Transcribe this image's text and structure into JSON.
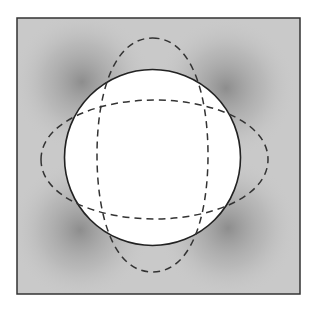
{
  "diagram": {
    "type": "deformation-illustration",
    "frame": {
      "x": 17,
      "y": 18,
      "width": 283,
      "height": 276,
      "stroke": "#333333",
      "background": "#c9c9c9"
    },
    "shading": {
      "dark_color": "#8a8a8a",
      "light_color": "#cbcbcb",
      "spots": [
        {
          "cx": 82,
          "cy": 82
        },
        {
          "cx": 226,
          "cy": 88
        },
        {
          "cx": 80,
          "cy": 230
        },
        {
          "cx": 228,
          "cy": 228
        }
      ]
    },
    "circle": {
      "cx": 152.5,
      "cy": 157.5,
      "r": 88,
      "fill": "#ffffff",
      "stroke": "#222222",
      "stroke_style": "solid"
    },
    "dashed_shapes": [
      {
        "name": "vertical-stretched-outline",
        "cx": 152.5,
        "cy": 155,
        "rx": 56,
        "ry": 117,
        "stroke": "#333333",
        "dash": "7 5"
      },
      {
        "name": "horizontal-stretched-outline",
        "cx": 154.5,
        "cy": 159.5,
        "rx": 114,
        "ry": 60,
        "stroke": "#333333",
        "dash": "7 5"
      }
    ]
  }
}
